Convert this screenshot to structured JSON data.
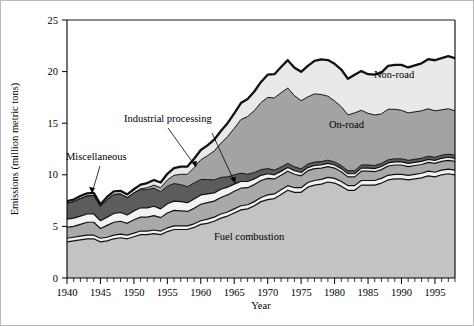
{
  "chart_data": {
    "type": "area",
    "stacked": true,
    "title": "",
    "xlabel": "Year",
    "ylabel": "Emissions (million metric tons)",
    "xlim": [
      1940,
      1998
    ],
    "ylim": [
      0,
      25
    ],
    "yticks": [
      0,
      5,
      10,
      15,
      20,
      25
    ],
    "ytick_labels": [
      "0",
      "5",
      "10",
      "15",
      "20",
      "25"
    ],
    "xticks": [
      1940,
      1945,
      1950,
      1955,
      1960,
      1965,
      1970,
      1975,
      1980,
      1985,
      1990,
      1995
    ],
    "xtick_labels": [
      "1940",
      "1945",
      "1950",
      "1955",
      "1960",
      "1965",
      "1970",
      "1975",
      "1980",
      "1985",
      "1990",
      "1995"
    ],
    "minor_xtick_interval": 1,
    "grid": false,
    "legend": "inline-annotations",
    "x": [
      1940,
      1941,
      1942,
      1943,
      1944,
      1945,
      1946,
      1947,
      1948,
      1949,
      1950,
      1951,
      1952,
      1953,
      1954,
      1955,
      1956,
      1957,
      1958,
      1959,
      1960,
      1961,
      1962,
      1963,
      1964,
      1965,
      1966,
      1967,
      1968,
      1969,
      1970,
      1971,
      1972,
      1973,
      1974,
      1975,
      1976,
      1977,
      1978,
      1979,
      1980,
      1981,
      1982,
      1983,
      1984,
      1985,
      1986,
      1987,
      1988,
      1989,
      1990,
      1991,
      1992,
      1993,
      1994,
      1995,
      1996,
      1997,
      1998
    ],
    "series": [
      {
        "name": "Fuel combustion",
        "color": "#c3c3c3",
        "values": [
          3.5,
          3.6,
          3.7,
          3.8,
          3.8,
          3.5,
          3.6,
          3.8,
          3.9,
          3.8,
          4.0,
          4.2,
          4.2,
          4.3,
          4.2,
          4.5,
          4.7,
          4.7,
          4.7,
          4.9,
          5.2,
          5.3,
          5.5,
          5.8,
          6.0,
          6.3,
          6.6,
          6.7,
          7.0,
          7.4,
          7.6,
          7.7,
          8.1,
          8.5,
          8.3,
          8.3,
          8.8,
          9.0,
          9.1,
          9.3,
          9.2,
          8.9,
          8.5,
          8.5,
          9.0,
          9.0,
          9.0,
          9.2,
          9.5,
          9.6,
          9.6,
          9.5,
          9.6,
          9.7,
          9.9,
          9.8,
          10.0,
          10.1,
          10.0
        ]
      },
      {
        "name": "gap-1",
        "color": "#f2f2f2",
        "values": [
          0.35,
          0.35,
          0.35,
          0.35,
          0.35,
          0.35,
          0.35,
          0.35,
          0.35,
          0.35,
          0.35,
          0.35,
          0.35,
          0.35,
          0.35,
          0.35,
          0.35,
          0.35,
          0.35,
          0.35,
          0.35,
          0.4,
          0.4,
          0.4,
          0.4,
          0.4,
          0.4,
          0.4,
          0.4,
          0.4,
          0.45,
          0.45,
          0.45,
          0.45,
          0.45,
          0.45,
          0.45,
          0.45,
          0.45,
          0.45,
          0.45,
          0.45,
          0.45,
          0.45,
          0.45,
          0.45,
          0.45,
          0.45,
          0.45,
          0.45,
          0.45,
          0.45,
          0.45,
          0.45,
          0.45,
          0.45,
          0.45,
          0.45,
          0.45
        ]
      },
      {
        "name": "Industrial processing",
        "color": "#a9a9a9",
        "values": [
          1.05,
          1.05,
          1.15,
          1.25,
          1.25,
          0.95,
          1.15,
          1.25,
          1.25,
          1.15,
          1.3,
          1.35,
          1.35,
          1.4,
          1.3,
          1.45,
          1.5,
          1.45,
          1.4,
          1.5,
          1.6,
          1.6,
          1.55,
          1.6,
          1.65,
          1.7,
          1.7,
          1.65,
          1.65,
          1.65,
          1.6,
          1.45,
          1.4,
          1.4,
          1.3,
          1.15,
          1.15,
          1.15,
          1.1,
          1.05,
          1.0,
          0.95,
          0.85,
          0.85,
          0.9,
          0.9,
          0.85,
          0.85,
          0.9,
          0.9,
          0.9,
          0.85,
          0.85,
          0.85,
          0.85,
          0.85,
          0.85,
          0.85,
          0.85
        ]
      },
      {
        "name": "gap-2",
        "color": "#f4f4f4",
        "values": [
          0.8,
          0.8,
          0.8,
          0.8,
          0.8,
          0.75,
          0.8,
          0.85,
          0.85,
          0.8,
          0.85,
          0.9,
          0.9,
          0.9,
          0.85,
          0.9,
          0.9,
          0.9,
          0.85,
          0.9,
          0.9,
          0.85,
          0.8,
          0.8,
          0.75,
          0.7,
          0.65,
          0.6,
          0.55,
          0.5,
          0.45,
          0.4,
          0.38,
          0.36,
          0.34,
          0.32,
          0.3,
          0.3,
          0.3,
          0.3,
          0.3,
          0.3,
          0.3,
          0.3,
          0.3,
          0.3,
          0.3,
          0.3,
          0.3,
          0.3,
          0.3,
          0.3,
          0.3,
          0.3,
          0.3,
          0.3,
          0.3,
          0.3,
          0.3
        ]
      },
      {
        "name": "Miscellaneous",
        "color": "#5c5c5c",
        "values": [
          1.55,
          1.6,
          1.7,
          1.75,
          1.8,
          1.4,
          1.7,
          1.85,
          1.8,
          1.7,
          1.75,
          1.75,
          1.75,
          1.75,
          1.65,
          1.7,
          1.7,
          1.65,
          1.55,
          1.55,
          1.5,
          1.4,
          1.25,
          1.15,
          1.0,
          0.9,
          0.8,
          0.7,
          0.62,
          0.55,
          0.5,
          0.45,
          0.42,
          0.4,
          0.38,
          0.36,
          0.35,
          0.34,
          0.33,
          0.32,
          0.3,
          0.3,
          0.3,
          0.3,
          0.3,
          0.3,
          0.3,
          0.3,
          0.3,
          0.3,
          0.3,
          0.3,
          0.3,
          0.3,
          0.3,
          0.3,
          0.3,
          0.3,
          0.3
        ]
      },
      {
        "name": "On-road",
        "color": "#a3a3a3",
        "values": [
          0.0,
          0.0,
          0.0,
          0.0,
          0.0,
          0.0,
          0.0,
          0.0,
          0.0,
          0.0,
          0.0,
          0.1,
          0.2,
          0.3,
          0.4,
          0.6,
          0.8,
          1.0,
          1.2,
          1.5,
          1.9,
          2.3,
          2.8,
          3.3,
          3.9,
          4.5,
          5.2,
          5.6,
          6.0,
          6.5,
          6.9,
          7.0,
          7.2,
          7.3,
          6.9,
          6.6,
          6.5,
          6.6,
          6.5,
          6.2,
          5.9,
          5.7,
          5.4,
          5.6,
          5.3,
          5.0,
          4.9,
          4.8,
          4.9,
          4.8,
          4.7,
          4.6,
          4.6,
          4.6,
          4.6,
          4.5,
          4.4,
          4.4,
          4.3
        ]
      },
      {
        "name": "Non-road",
        "color": "#e9e9e9",
        "values": [
          0.2,
          0.2,
          0.25,
          0.25,
          0.25,
          0.2,
          0.25,
          0.3,
          0.3,
          0.3,
          0.35,
          0.4,
          0.45,
          0.5,
          0.5,
          0.6,
          0.7,
          0.75,
          0.75,
          0.85,
          0.95,
          1.0,
          1.1,
          1.2,
          1.3,
          1.45,
          1.6,
          1.7,
          1.85,
          2.0,
          2.2,
          2.3,
          2.5,
          2.7,
          2.7,
          2.8,
          3.0,
          3.2,
          3.4,
          3.5,
          3.6,
          3.6,
          3.5,
          3.7,
          3.8,
          3.8,
          3.9,
          4.0,
          4.2,
          4.3,
          4.4,
          4.4,
          4.5,
          4.6,
          4.8,
          4.9,
          5.0,
          5.1,
          5.1
        ]
      }
    ],
    "annotations": [
      {
        "label": "Non-road",
        "x_px": 374,
        "y_px": 78
      },
      {
        "label": "On-road",
        "x_px": 329,
        "y_px": 128
      },
      {
        "label": "Industrial processing",
        "x_px": 124,
        "y_px": 122
      },
      {
        "label": "Miscellaneous",
        "x_px": 66,
        "y_px": 160
      },
      {
        "label": "Fuel combustion",
        "x_px": 214,
        "y_px": 240
      }
    ]
  },
  "axis": {
    "y_title": "Emissions (million metric tons)",
    "x_title": "Year"
  }
}
